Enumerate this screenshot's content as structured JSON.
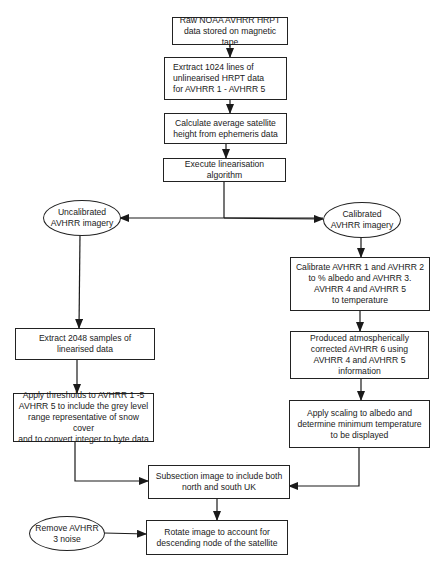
{
  "diagram": {
    "type": "flowchart",
    "nodes": {
      "raw_data": "Raw NOAA AVHRR HRPT\ndata stored on magnetic tape",
      "extract_lines": "Exrtract 1024 lines of\nunlinearised HRPT data\nfor AVHRR 1 - AVHRR 5",
      "calc_height": "Calculate average satellite\nheight from ephemeris data",
      "linearisation": "Execute linearisation algorithm",
      "uncalibrated": "Uncalibrated\nAVHRR imagery",
      "calibrated": "Calibrated\nAVHRR imagery",
      "calibrate": "Calibrate AVHRR 1 and AVHRR 2\nto % albedo and AVHRR 3.\nAVHRR 4 and AVHRR 5\nto temperature",
      "atmos_corrected": "Produced atmospherically\ncorrected AVHRR 6 using\nAVHRR 4 and AVHRR 5\ninformation",
      "apply_scaling": "Apply scaling to albedo and\ndetermine minimum temperature\nto be displayed",
      "extract_samples": "Extract 2048 samples of\nlinearised data",
      "thresholds": "Apply thresholds to AVHRR 1 -5\nAVHRR 5 to include the grey level\nrange representative of snow cover\nand to convert integer to byte data",
      "subsection": "Subsection image to include both\nnorth and south UK",
      "remove_noise": "Remove AVHRR\n3 noise",
      "rotate": "Rotate image to account for\ndescending node of the satellite"
    },
    "edges": [
      [
        "raw_data",
        "extract_lines"
      ],
      [
        "extract_lines",
        "calc_height"
      ],
      [
        "calc_height",
        "linearisation"
      ],
      [
        "linearisation",
        "uncalibrated"
      ],
      [
        "linearisation",
        "calibrated"
      ],
      [
        "uncalibrated",
        "extract_samples"
      ],
      [
        "extract_samples",
        "thresholds"
      ],
      [
        "thresholds",
        "subsection"
      ],
      [
        "calibrated",
        "calibrate"
      ],
      [
        "calibrate",
        "atmos_corrected"
      ],
      [
        "atmos_corrected",
        "apply_scaling"
      ],
      [
        "apply_scaling",
        "subsection"
      ],
      [
        "subsection",
        "rotate"
      ],
      [
        "remove_noise",
        "rotate"
      ]
    ]
  }
}
